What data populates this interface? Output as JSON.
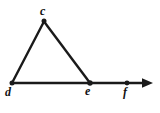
{
  "figure": {
    "background_color": "#ffffff",
    "stroke_color": "#1a1a1a",
    "labels": {
      "c": "c",
      "d": "d",
      "e": "e",
      "f": "f"
    },
    "points": [
      {
        "name": "c",
        "label": "c",
        "x": 44,
        "y": 21
      },
      {
        "name": "d",
        "label": "d",
        "x": 12,
        "y": 83
      },
      {
        "name": "e",
        "label": "e",
        "x": 90,
        "y": 83
      },
      {
        "name": "f",
        "label": "f",
        "x": 127,
        "y": 83
      }
    ],
    "segments": [
      {
        "name": "segment-cd",
        "from": "c",
        "to": "d"
      },
      {
        "name": "segment-ce",
        "from": "c",
        "to": "e"
      },
      {
        "name": "ray-df",
        "from": "d",
        "to": "arrow-tip"
      }
    ],
    "ray": {
      "name": "ray-df",
      "start_x": 12,
      "end_x": 152,
      "y": 83,
      "arrowhead": "right-arrow"
    }
  }
}
